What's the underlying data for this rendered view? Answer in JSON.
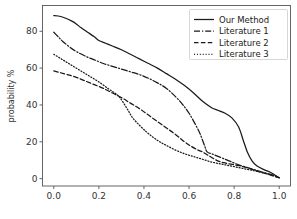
{
  "chart_data": {
    "type": "line",
    "title": "",
    "xlabel": "",
    "ylabel": "probability %",
    "xlim": [
      -0.05,
      1.05
    ],
    "ylim": [
      -4,
      94
    ],
    "grid": false,
    "legend_position": "upper right",
    "xticks": [
      "0.0",
      "0.2",
      "0.4",
      "0.6",
      "0.8",
      "1.0"
    ],
    "xtick_values": [
      0.0,
      0.2,
      0.4,
      0.6,
      0.8,
      1.0
    ],
    "yticks": [
      "0",
      "20",
      "40",
      "60",
      "80"
    ],
    "ytick_values": [
      0,
      20,
      40,
      60,
      80
    ],
    "series": [
      {
        "name": "Our Method",
        "style": "solid",
        "color": "#1a1a1a",
        "x": [
          0.0,
          0.02,
          0.05,
          0.08,
          0.1,
          0.12,
          0.15,
          0.18,
          0.2,
          0.23,
          0.26,
          0.3,
          0.34,
          0.38,
          0.42,
          0.46,
          0.5,
          0.54,
          0.58,
          0.62,
          0.66,
          0.7,
          0.73,
          0.76,
          0.79,
          0.82,
          0.84,
          0.86,
          0.88,
          0.9,
          0.93,
          0.96,
          0.98,
          1.0
        ],
        "y": [
          88.5,
          88.3,
          87.2,
          85.5,
          84.0,
          82.0,
          79.5,
          77.0,
          75.0,
          73.5,
          72.0,
          70.0,
          67.5,
          65.0,
          62.5,
          60.0,
          57.0,
          54.0,
          50.5,
          46.5,
          42.0,
          38.5,
          37.0,
          35.5,
          33.0,
          28.0,
          21.0,
          14.0,
          9.5,
          7.0,
          5.0,
          3.5,
          2.0,
          0.5
        ]
      },
      {
        "name": "Literature 1",
        "style": "dashdot",
        "color": "#1a1a1a",
        "x": [
          0.0,
          0.02,
          0.04,
          0.07,
          0.1,
          0.14,
          0.18,
          0.22,
          0.26,
          0.3,
          0.34,
          0.38,
          0.42,
          0.46,
          0.5,
          0.54,
          0.57,
          0.6,
          0.63,
          0.65,
          0.67,
          0.68,
          0.7,
          0.72,
          0.75,
          0.78,
          0.82,
          0.86,
          0.9,
          0.94,
          0.97,
          1.0
        ],
        "y": [
          79.5,
          77.0,
          74.5,
          71.5,
          69.0,
          66.5,
          64.5,
          62.5,
          61.0,
          59.5,
          58.0,
          56.5,
          54.5,
          52.0,
          49.0,
          44.5,
          40.5,
          35.5,
          29.0,
          24.0,
          17.5,
          14.5,
          13.5,
          12.5,
          11.0,
          9.5,
          7.5,
          6.0,
          4.5,
          3.0,
          2.0,
          0.5
        ]
      },
      {
        "name": "Literature 2",
        "style": "dashed",
        "color": "#1a1a1a",
        "x": [
          0.0,
          0.03,
          0.06,
          0.1,
          0.14,
          0.18,
          0.22,
          0.26,
          0.3,
          0.34,
          0.38,
          0.42,
          0.46,
          0.5,
          0.54,
          0.58,
          0.61,
          0.64,
          0.66,
          0.68,
          0.7,
          0.73,
          0.76,
          0.8,
          0.84,
          0.88,
          0.92,
          0.96,
          0.98,
          1.0
        ],
        "y": [
          58.5,
          57.5,
          56.5,
          55.0,
          53.0,
          51.0,
          49.0,
          46.5,
          44.0,
          41.0,
          38.0,
          34.5,
          31.0,
          27.5,
          24.0,
          20.0,
          17.5,
          15.5,
          14.5,
          13.0,
          11.5,
          9.5,
          8.5,
          7.5,
          6.5,
          5.0,
          3.5,
          2.0,
          1.2,
          0.5
        ]
      },
      {
        "name": "Literature 3",
        "style": "dotted",
        "color": "#1a1a1a",
        "x": [
          0.0,
          0.04,
          0.08,
          0.12,
          0.16,
          0.2,
          0.24,
          0.27,
          0.29,
          0.31,
          0.33,
          0.35,
          0.38,
          0.41,
          0.44,
          0.47,
          0.5,
          0.54,
          0.58,
          0.62,
          0.66,
          0.7,
          0.74,
          0.78,
          0.82,
          0.86,
          0.9,
          0.94,
          0.97,
          1.0
        ],
        "y": [
          67.5,
          64.5,
          61.5,
          58.5,
          55.5,
          52.5,
          49.0,
          46.5,
          44.5,
          41.0,
          37.0,
          33.0,
          29.0,
          25.5,
          22.5,
          20.0,
          18.0,
          15.5,
          13.5,
          12.0,
          10.5,
          9.0,
          8.0,
          7.0,
          6.0,
          5.0,
          4.0,
          2.8,
          1.8,
          0.5
        ]
      }
    ]
  },
  "legend": {
    "entries": [
      {
        "label": "Our Method",
        "style": "solid"
      },
      {
        "label": "Literature 1",
        "style": "dashdot"
      },
      {
        "label": "Literature 2",
        "style": "dashed"
      },
      {
        "label": "Literature 3",
        "style": "dotted"
      }
    ]
  }
}
